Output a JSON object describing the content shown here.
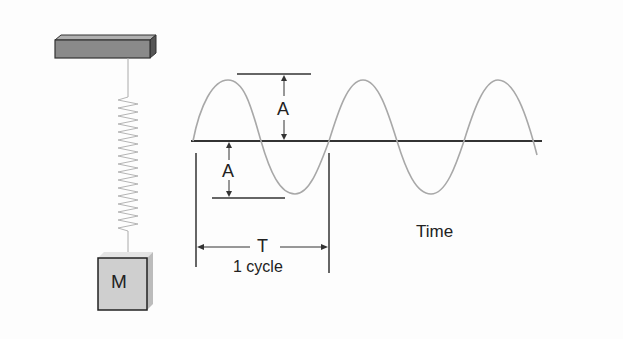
{
  "diagram": {
    "mass_label": "M",
    "amplitude_label_top": "A",
    "amplitude_label_bottom": "A",
    "period_label": "T",
    "cycle_label": "1 cycle",
    "axis_label": "Time",
    "colors": {
      "background": "#fdfdfd",
      "wave": "#a8a8a8",
      "axis": "#333333",
      "block_face": "#cfcfcf",
      "block_side": "#9a9a9a",
      "bar_face": "#8a8a8a",
      "spring": "#b5b5b5"
    }
  }
}
